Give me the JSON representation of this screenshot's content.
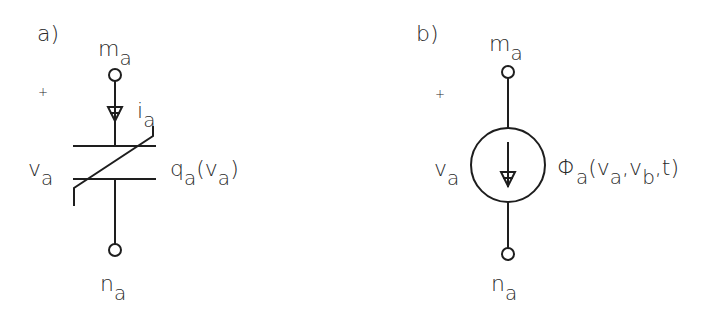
{
  "panels": [
    {
      "id": "a",
      "tag": "a)",
      "element": "nonlinear-capacitor",
      "top_node": {
        "base": "m",
        "sub": "a"
      },
      "bottom_node": {
        "base": "n",
        "sub": "a"
      },
      "current": {
        "base": "i",
        "sub": "a"
      },
      "voltage": {
        "base": "v",
        "sub": "a"
      },
      "plus": "+",
      "charge": {
        "base": "q",
        "sub": "a",
        "open": "(",
        "arg_base": "v",
        "arg_sub": "a",
        "close": ")"
      }
    },
    {
      "id": "b",
      "tag": "b)",
      "element": "controlled-current-source",
      "top_node": {
        "base": "m",
        "sub": "a"
      },
      "bottom_node": {
        "base": "n",
        "sub": "a"
      },
      "voltage": {
        "base": "v",
        "sub": "a"
      },
      "plus": "+",
      "source": {
        "base": "Φ",
        "sub": "a",
        "open": "(",
        "arg1_base": "v",
        "arg1_sub": "a",
        "sep1": ",",
        "arg2_base": "v",
        "arg2_sub": "b",
        "sep2": ",",
        "arg3": "t",
        "close": ")"
      }
    }
  ],
  "colors": {
    "stroke": "#1e1e1e",
    "text": "#2a2a2a",
    "background": "#ffffff"
  }
}
